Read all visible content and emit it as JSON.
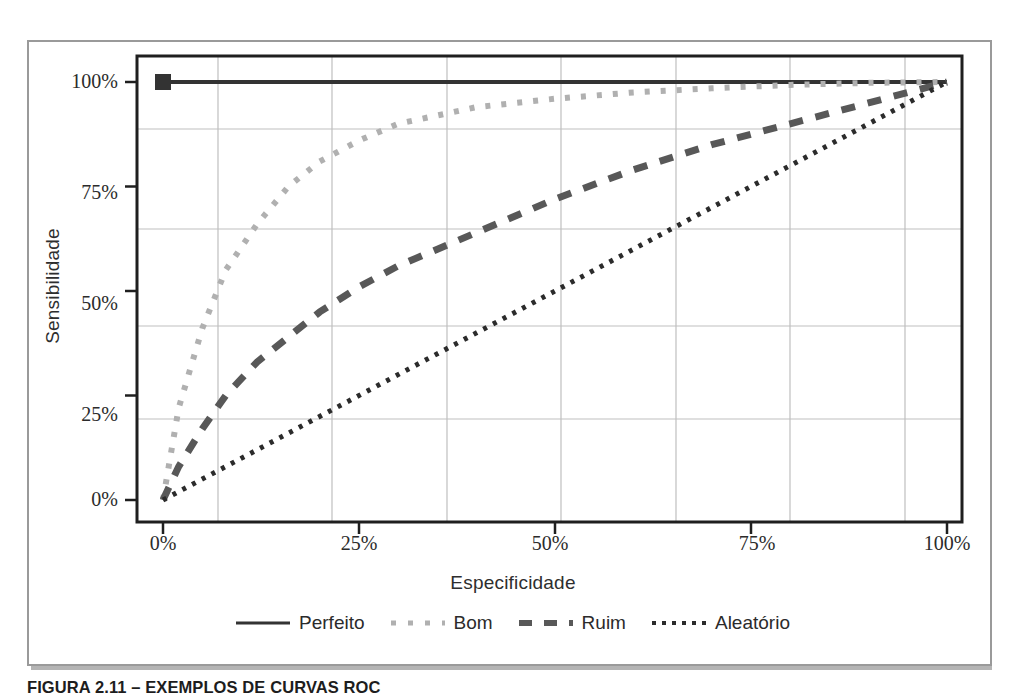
{
  "figure": {
    "caption": "FIGURA 2.11 – EXEMPLOS DE CURVAS ROC"
  },
  "colors": {
    "perfeito": "#333333",
    "bom": "#b0b0b0",
    "ruim": "#585858",
    "aleatorio": "#2b2b2b",
    "grid": "#bfbfbf",
    "axis": "#1f1f1f",
    "frame": "#9a9a9a"
  },
  "axes": {
    "x_label": "Especificidade",
    "y_label": "Sensibilidade",
    "x_ticks": [
      "0%",
      "25%",
      "50%",
      "75%",
      "100%"
    ],
    "y_ticks": [
      "100%",
      "75%",
      "50%",
      "25%",
      "0%"
    ]
  },
  "legend": {
    "items": [
      {
        "label": "Perfeito",
        "style": "solid"
      },
      {
        "label": "Bom",
        "style": "dotted"
      },
      {
        "label": "Ruim",
        "style": "dashed"
      },
      {
        "label": "Aleatório",
        "style": "fine-dotted"
      }
    ]
  },
  "chart_data": {
    "type": "line",
    "title": "EXEMPLOS DE CURVAS ROC",
    "xlabel": "Especificidade",
    "ylabel": "Sensibilidade",
    "xlim": [
      0,
      100
    ],
    "ylim": [
      0,
      100
    ],
    "xticks": [
      0,
      25,
      50,
      75,
      100
    ],
    "yticks": [
      0,
      25,
      50,
      75,
      100
    ],
    "grid": true,
    "legend_position": "bottom",
    "series": [
      {
        "name": "Perfeito",
        "style": "solid",
        "color": "#333333",
        "marker": "square-at-start",
        "x": [
          0,
          100
        ],
        "y": [
          100,
          100
        ]
      },
      {
        "name": "Bom",
        "style": "dotted",
        "color": "#b0b0b0",
        "x": [
          0,
          2,
          5,
          8,
          12,
          16,
          20,
          25,
          30,
          35,
          40,
          50,
          60,
          70,
          80,
          90,
          100
        ],
        "y": [
          0,
          22,
          41,
          55,
          66,
          75,
          81,
          86,
          90,
          92,
          94,
          96,
          97.5,
          98.5,
          99.3,
          99.8,
          100
        ]
      },
      {
        "name": "Ruim",
        "style": "dashed",
        "color": "#585858",
        "x": [
          0,
          2,
          5,
          8,
          12,
          16,
          20,
          25,
          30,
          35,
          40,
          50,
          60,
          70,
          80,
          90,
          100
        ],
        "y": [
          0,
          8,
          17,
          25,
          33,
          39,
          45,
          51,
          56,
          60,
          64,
          72,
          79,
          85,
          90,
          95,
          100
        ]
      },
      {
        "name": "Aleatório",
        "style": "fine-dotted",
        "color": "#2b2b2b",
        "x": [
          0,
          100
        ],
        "y": [
          0,
          100
        ]
      }
    ]
  }
}
